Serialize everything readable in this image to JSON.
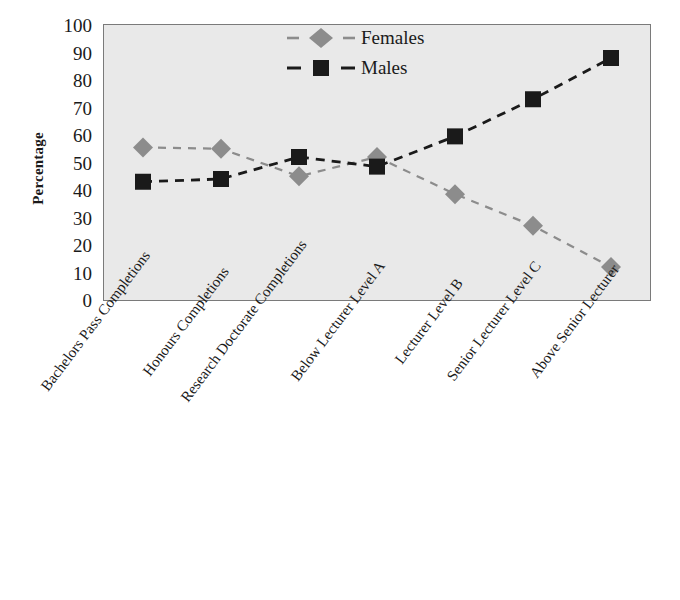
{
  "chart_data": {
    "type": "line",
    "title": "",
    "subtitle": "",
    "xlabel": "",
    "ylabel": "Percentage",
    "ylim": [
      0,
      100
    ],
    "yticks": [
      0,
      10,
      20,
      30,
      40,
      50,
      60,
      70,
      80,
      90,
      100
    ],
    "grid": false,
    "legend_position": "top-center",
    "categories": [
      "Bachelors Pass Completions",
      "Honours Completions",
      "Research Doctorate Completions",
      "Below Lecturer Level A",
      "Lecturer Level B",
      "Senior Lecturer Level C",
      "Above Senior Lecturer"
    ],
    "series": [
      {
        "name": "Females",
        "marker": "diamond",
        "color": "#8c8c8c",
        "line_style": "dashed",
        "values": [
          55.5,
          55,
          45,
          52,
          38.5,
          27,
          12
        ]
      },
      {
        "name": "Males",
        "marker": "square",
        "color": "#1a1a1a",
        "line_style": "dashed",
        "values": [
          43,
          44,
          52,
          48.5,
          59.5,
          73,
          88
        ]
      }
    ]
  },
  "axes": {
    "y_title": "Percentage",
    "y_tick_labels": [
      "100",
      "90",
      "80",
      "70",
      "60",
      "50",
      "40",
      "30",
      "20",
      "10",
      "0"
    ],
    "x_tick_labels": [
      "Bachelors Pass Completions",
      "Honours Completions",
      "Research Doctorate Completions",
      "Below Lecturer Level A",
      "Lecturer Level B",
      "Senior Lecturer Level C",
      "Above Senior Lecturer"
    ]
  },
  "legend": {
    "entries": [
      {
        "label": "Females",
        "marker": "diamond-marker",
        "color": "#8c8c8c"
      },
      {
        "label": "Males",
        "marker": "square-marker",
        "color": "#1a1a1a"
      }
    ]
  },
  "style": {
    "plot_background": "#e9e9e9",
    "plot_border": "#7a7a7a",
    "page_background": "#ffffff",
    "females_color": "#8c8c8c",
    "males_color": "#1a1a1a"
  }
}
